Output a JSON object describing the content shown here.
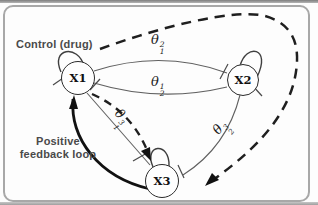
{
  "figure": {
    "labels": {
      "control": "Control (drug)",
      "feedback_line1": "Positive",
      "feedback_line2": "feedback loop"
    },
    "nodes": [
      {
        "id": "x1",
        "label": "X1"
      },
      {
        "id": "x2",
        "label": "X2"
      },
      {
        "id": "x3",
        "label": "X3"
      }
    ],
    "edge_labels": [
      {
        "id": "theta-1-2",
        "symbol": "θ",
        "sub": "1",
        "sup": "2"
      },
      {
        "id": "theta-2-1",
        "symbol": "θ",
        "sub": "2",
        "sup": "1"
      },
      {
        "id": "theta-1-3",
        "symbol": "θ",
        "sub": "1",
        "sup": "3"
      },
      {
        "id": "theta-2-3",
        "symbol": "θ",
        "sub": "2",
        "sup": "3"
      }
    ],
    "colors": {
      "edge": "#606060",
      "node_border": "#2b2b2b",
      "control_dash": "#1f1f1f",
      "feedback": "#111111",
      "text_gray": "#4a4a4a",
      "frame": "#a8a8a8"
    }
  }
}
